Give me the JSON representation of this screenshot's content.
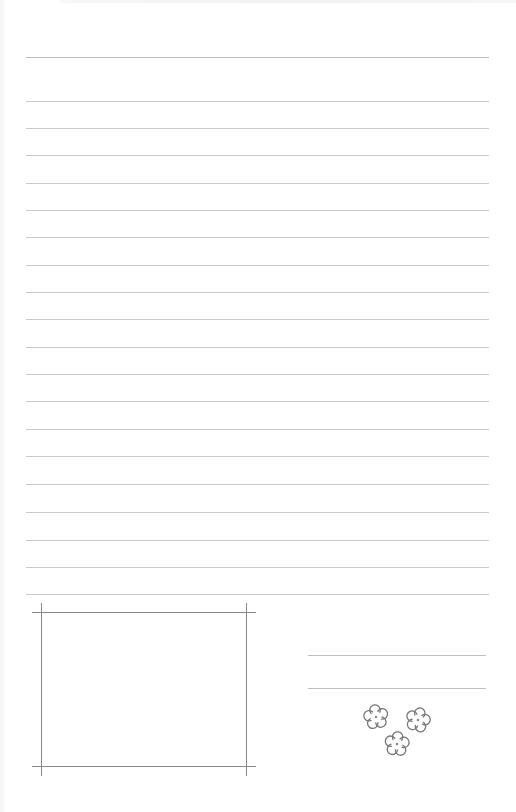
{
  "page": {
    "type": "lined-letter-paper",
    "background": "#ffffff",
    "line_color": "#c9c9c9",
    "frame_color": "#888888",
    "flower_color": "#777777"
  },
  "ruled_lines": {
    "count": 20,
    "y_positions": [
      57,
      101,
      128,
      155,
      183,
      210,
      237,
      265,
      292,
      319,
      347,
      374,
      401,
      429,
      456,
      484,
      512,
      540,
      567,
      594
    ]
  },
  "photo_frame": {
    "label": ""
  },
  "signature_lines": {
    "count": 2,
    "y_positions": [
      655,
      688
    ]
  },
  "decoration": {
    "icon": "flower-cluster-icon",
    "count": 3
  }
}
